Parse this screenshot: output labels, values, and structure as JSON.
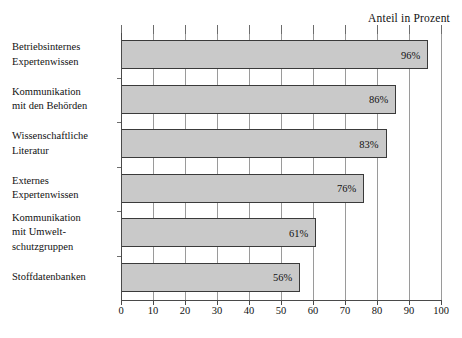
{
  "chart_data": {
    "type": "bar",
    "orientation": "horizontal",
    "title": "Anteil in Prozent",
    "xlabel": "",
    "ylabel": "",
    "xlim": [
      0,
      100
    ],
    "grid": true,
    "legend": null,
    "categories": [
      "Betriebsinternes Expertenwissen",
      "Kommunikation mit den Behörden",
      "Wissenschaftliche Literatur",
      "Externes Expertenwissen",
      "Kommunikation mit Umweltschutzgruppen",
      "Stoffdatenbanken"
    ],
    "category_lines": [
      [
        "Betriebsinternes",
        "Expertenwissen"
      ],
      [
        "Kommunikation",
        "mit den Behörden"
      ],
      [
        "Wissenschaftliche",
        "Literatur"
      ],
      [
        "Externes",
        "Expertenwissen"
      ],
      [
        "Kommunikation",
        "mit Umwelt-",
        "schutzgruppen"
      ],
      [
        "Stoffdatenbanken"
      ]
    ],
    "values": [
      96,
      86,
      83,
      76,
      61,
      56
    ],
    "value_labels": [
      "96%",
      "86%",
      "83%",
      "76%",
      "61%",
      "56%"
    ],
    "xticks": [
      0,
      10,
      20,
      30,
      40,
      50,
      60,
      70,
      80,
      90,
      100
    ],
    "xticklabels": [
      "0",
      "10",
      "20",
      "30",
      "40",
      "50",
      "60",
      "70",
      "80",
      "90",
      "100"
    ],
    "colors": {
      "bar_fill": "#c9c9c9",
      "bar_border": "#3a3a3a",
      "gridline": "#9a9a9a",
      "axis": "#4a4a4a",
      "text": "#111111",
      "background": "#ffffff"
    }
  }
}
